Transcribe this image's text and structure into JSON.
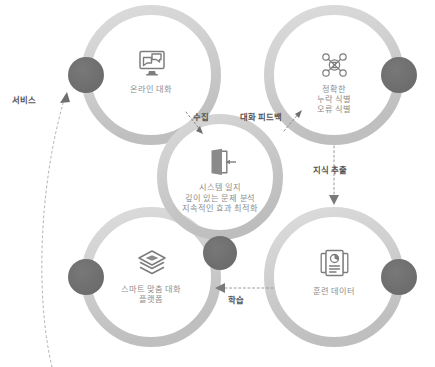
{
  "diagram": {
    "colors": {
      "ring": "#d2d2d2",
      "ring_shadow": "#bdbdbd",
      "dark_circle": "#6e6e6e",
      "label_text": "#8d8d8d",
      "connector_text": "#555555",
      "icon": "#7d7d7d",
      "background": "#ffffff"
    },
    "nodes": [
      {
        "id": "online-conversation",
        "position": "top-left",
        "icon": "monitor-chat-icon",
        "label": "온라인 대화"
      },
      {
        "id": "accurate-identification",
        "position": "top-right",
        "icon": "network-nodes-icon",
        "label": "정확한\n누락 식별\n오류 식별"
      },
      {
        "id": "system-log",
        "position": "center",
        "icon": "open-door-icon",
        "label": "시스템 일지\n깊이 있는 문제 분석\n지속적인 효과 최적화"
      },
      {
        "id": "smart-platform",
        "position": "bottom-left",
        "icon": "stacked-layers-icon",
        "label": "스마트 맞춤 대화\n플랫폼"
      },
      {
        "id": "training-data",
        "position": "bottom-right",
        "icon": "documents-chart-icon",
        "label": "훈련 데이터"
      }
    ],
    "connectors": [
      {
        "id": "collect",
        "label": "수집",
        "from": "online-conversation",
        "to": "system-log",
        "style": "dotted-arrow"
      },
      {
        "id": "conversation-feedback",
        "label": "대화 피드백",
        "from": "system-log",
        "to": "accurate-identification",
        "style": "dotted-arrow"
      },
      {
        "id": "knowledge-extraction",
        "label": "지식 추출",
        "from": "accurate-identification",
        "to": "training-data",
        "style": "dotted-arrow-down"
      },
      {
        "id": "learning",
        "label": "학습",
        "from": "training-data",
        "to": "smart-platform",
        "style": "dotted-arrow-left"
      },
      {
        "id": "service",
        "label": "서비스",
        "from": "smart-platform",
        "to": "online-conversation",
        "style": "dotted-curve-arrow"
      }
    ]
  }
}
